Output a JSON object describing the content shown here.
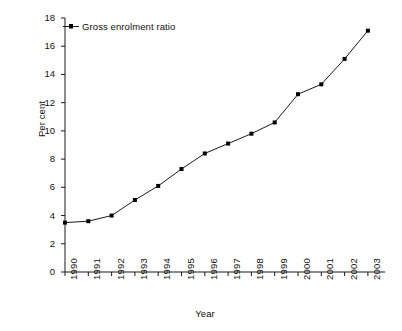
{
  "chart_data": {
    "type": "line",
    "title": "",
    "xlabel": "Year",
    "ylabel": "Per cent",
    "categories": [
      "1990",
      "1991",
      "1992",
      "1993",
      "1994",
      "1995",
      "1996",
      "1997",
      "1998",
      "1999",
      "2000",
      "2001",
      "2002",
      "2003"
    ],
    "series": [
      {
        "name": "Gross enrolment ratio",
        "values": [
          3.5,
          3.6,
          4.0,
          5.1,
          6.1,
          7.3,
          8.4,
          9.1,
          9.8,
          10.6,
          12.6,
          13.3,
          15.1,
          17.1
        ]
      }
    ],
    "ylim": [
      0,
      18
    ],
    "yticks": [
      0,
      2,
      4,
      6,
      8,
      10,
      12,
      14,
      16,
      18
    ],
    "ytick_labels": [
      "0",
      "2",
      "4",
      "6",
      "8",
      "10",
      "12",
      "14",
      "16",
      "18"
    ],
    "grid": false,
    "legend_position": "top-left",
    "marker": "square",
    "line_color": "#1a1a1a",
    "marker_color": "#000000",
    "axis_color": "#1a1a1a",
    "background": "#ffffff"
  },
  "legend": {
    "entries": [
      {
        "label": "Gross enrolment ratio",
        "symbol": "line-marker-symbol"
      }
    ]
  }
}
